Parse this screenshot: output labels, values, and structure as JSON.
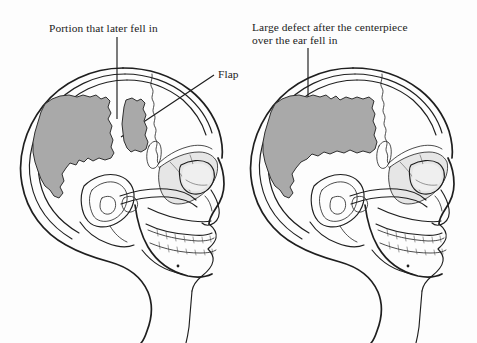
{
  "figure": {
    "background_color": "#fdfdfd",
    "ink_color": "#1f1f1f",
    "defect_fill_color": "#a9a9a9"
  },
  "labels": {
    "left": {
      "text": "Portion that later fell in",
      "leader": "vertical-line"
    },
    "flap": {
      "text": "Flap",
      "leader": "diagonal-line"
    },
    "right": {
      "line1": "Large defect after the centerpiece",
      "line2": "over the ear fell in",
      "leader": "vertical-line"
    }
  },
  "panels": [
    {
      "name": "left-skull",
      "caption": "Portion that later fell in",
      "defect_regions": [
        "large-posterior-defect",
        "flap-fragment"
      ]
    },
    {
      "name": "right-skull",
      "caption": "Large defect after the centerpiece over the ear fell in",
      "defect_regions": [
        "large-merged-defect"
      ]
    }
  ]
}
